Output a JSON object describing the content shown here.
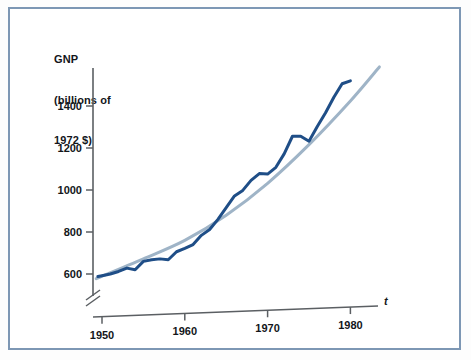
{
  "figure": {
    "border_color": "#7d97b4",
    "background": "#ffffff"
  },
  "axes": {
    "y_title_line1": "GNP",
    "y_title_line2": "(billions of",
    "y_title_line3": "1972 $)",
    "x_symbol": "t",
    "axis_color": "#5b5f63",
    "break_marker": "axis-break-double-slash"
  },
  "chart_data": {
    "type": "line",
    "title": "",
    "xlabel": "t",
    "ylabel": "GNP (billions of 1972 $)",
    "xlim": [
      1948,
      1984
    ],
    "ylim": [
      540,
      1600
    ],
    "grid": false,
    "legend": "none",
    "y_ticks": [
      600,
      800,
      1000,
      1200,
      1400
    ],
    "y_tick_labels": [
      "600",
      "800",
      "1000",
      "1200",
      "1400"
    ],
    "x_ticks": [
      1950,
      1960,
      1970,
      1980
    ],
    "x_tick_labels": [
      "1950",
      "1960",
      "1970",
      "1980"
    ],
    "axis_break": true,
    "series": [
      {
        "name": "actual-gnp",
        "color": "#1f4e87",
        "style": "solid-zigzag",
        "width": 3,
        "x": [
          1949.5,
          1950,
          1951,
          1952,
          1953,
          1954,
          1955,
          1956,
          1957,
          1958,
          1959,
          1960,
          1961,
          1962,
          1963,
          1964,
          1965,
          1966,
          1967,
          1968,
          1969,
          1970,
          1971,
          1972,
          1973,
          1974,
          1975,
          1976,
          1977,
          1978,
          1979,
          1980
        ],
        "values": [
          588,
          592,
          600,
          612,
          628,
          620,
          660,
          668,
          672,
          668,
          706,
          722,
          740,
          784,
          812,
          860,
          916,
          972,
          998,
          1046,
          1078,
          1076,
          1108,
          1172,
          1256,
          1256,
          1232,
          1302,
          1368,
          1442,
          1506,
          1520
        ]
      },
      {
        "name": "trend-line",
        "color": "#9fb4c7",
        "style": "solid-smooth",
        "width": 3,
        "x": [
          1949.3,
          1955,
          1960,
          1965,
          1970,
          1975,
          1980,
          1983.5
        ],
        "values": [
          578,
          672,
          760,
          880,
          1032,
          1216,
          1424,
          1586
        ]
      }
    ]
  }
}
